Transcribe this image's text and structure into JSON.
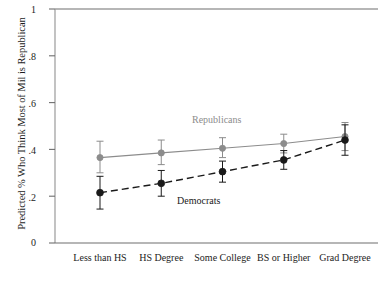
{
  "chart_data": {
    "type": "line",
    "title": "",
    "subtitle": "",
    "xlabel": "",
    "ylabel": "Predicted % Who Think Most of Mil is Republican",
    "categories": [
      "Less than HS",
      "HS Degree",
      "Some College",
      "BS or Higher",
      "Grad Degree"
    ],
    "ylim": [
      0,
      1
    ],
    "yticks": [
      "0",
      ".2",
      ".4",
      ".6",
      ".8",
      "1"
    ],
    "ytick_values": [
      0,
      0.2,
      0.4,
      0.6,
      0.8,
      1
    ],
    "grid": false,
    "legend_position": "inline-annotations",
    "series": [
      {
        "name": "Republicans",
        "color": "#8c8c8c",
        "line_style": "solid",
        "marker": "circle",
        "values": [
          0.365,
          0.385,
          0.405,
          0.425,
          0.455
        ],
        "ci_low": [
          0.3,
          0.335,
          0.365,
          0.385,
          0.395
        ],
        "ci_high": [
          0.435,
          0.44,
          0.45,
          0.465,
          0.515
        ]
      },
      {
        "name": "Democrats",
        "color": "#1a1a1a",
        "line_style": "dashed",
        "marker": "circle-filled",
        "values": [
          0.215,
          0.255,
          0.305,
          0.355,
          0.44
        ],
        "ci_low": [
          0.145,
          0.2,
          0.26,
          0.315,
          0.375
        ],
        "ci_high": [
          0.285,
          0.31,
          0.35,
          0.395,
          0.505
        ]
      }
    ],
    "annotations": [
      {
        "text": "Republicans",
        "x": 2,
        "y": 0.5,
        "color": "#8c8c8c"
      },
      {
        "text": "Democrats",
        "x": 2.1,
        "y": 0.175,
        "color": "#1a1a1a"
      }
    ]
  }
}
